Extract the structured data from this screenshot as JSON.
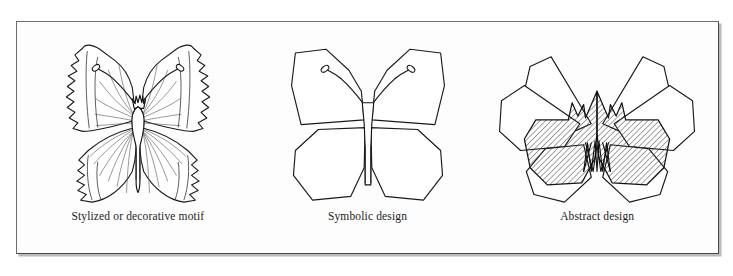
{
  "figure": {
    "background_color": "#ffffff",
    "frame_color": "#5c5c5c",
    "plate_fill": "#fdfdfd",
    "ink_color": "#1a1a1a",
    "hatch_color": "#4a4a4a"
  },
  "panels": [
    {
      "id": "panel-stylized",
      "caption": "Stylized or decorative motif",
      "art_name": "butterfly-stylized-illustration",
      "art_description": "Naturalistic butterfly line drawing with scalloped wing edges, marginal border band and radiating wing veins"
    },
    {
      "id": "panel-symbolic",
      "caption": "Symbolic design",
      "art_name": "butterfly-symbolic-illustration",
      "art_description": "Simplified butterfly reduced to four straight-edged polygonal wings with a narrow rectangular body and looped antennae"
    },
    {
      "id": "panel-abstract",
      "caption": "Abstract design",
      "art_name": "butterfly-abstract-illustration",
      "art_description": "Abstracted butterfly of overlapping angular petals with a diagonally hatched central mass and zigzag motif at the core"
    }
  ]
}
